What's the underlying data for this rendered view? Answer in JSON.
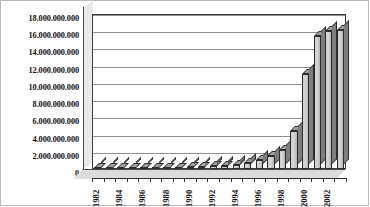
{
  "chart_data": {
    "type": "bar",
    "title": "",
    "subtitle": "",
    "xlabel": "",
    "ylabel": "",
    "ylim": [
      0,
      18000000000
    ],
    "ytick_step": 2000000000,
    "grid": true,
    "legend": false,
    "legend_position": "none",
    "style": "3d-column-grayscale",
    "number_format": "european-dot-thousands",
    "ytick_labels": [
      "18.000.000.000",
      "16.000.000.000",
      "14.000.000.000",
      "12.000.000.000",
      "10.000.000.000",
      "8.000.000.000",
      "6.000.000.000",
      "4.000.000.000",
      "2.000.000.000",
      "0"
    ],
    "ytick_values": [
      18000000000,
      16000000000,
      14000000000,
      12000000000,
      10000000000,
      8000000000,
      6000000000,
      4000000000,
      2000000000,
      0
    ],
    "categories": [
      "1982",
      "1983",
      "1984",
      "1985",
      "1986",
      "1987",
      "1988",
      "1989",
      "1990",
      "1991",
      "1992",
      "1993",
      "1994",
      "1995",
      "1996",
      "1997",
      "1998",
      "1999",
      "2000",
      "2001",
      "2002",
      "2003"
    ],
    "xtick_labels_shown": [
      "1982",
      "1984",
      "1986",
      "1988",
      "1990",
      "1992",
      "1994",
      "1996",
      "1998",
      "2000",
      "2002"
    ],
    "xtick_label_interval": 2,
    "values": [
      20000000,
      30000000,
      40000000,
      55000000,
      70000000,
      90000000,
      120000000,
      150000000,
      190000000,
      240000000,
      300000000,
      380000000,
      500000000,
      750000000,
      1100000000,
      1500000000,
      2200000000,
      4400000000,
      11000000000,
      15400000000,
      16000000000,
      16100000000
    ]
  },
  "colors": {
    "bar_face": "#d2d2d2",
    "bar_side": "#7e7e7e",
    "bar_top": "#9e9e9e",
    "bar_outline": "#2d2d2d",
    "gridline": "#8f8f8f",
    "plot_background": "#ffffff",
    "floor": "#dcdcdc",
    "side_wall": "#e9e9e9",
    "axis": "#3c3c3c",
    "text": "#111111",
    "figure_border": "#b9b9b9"
  }
}
